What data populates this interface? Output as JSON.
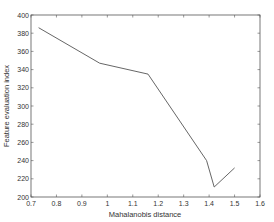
{
  "chart_data": {
    "type": "line",
    "title": "",
    "xlabel": "Mahalanobis distance",
    "ylabel": "Feature evaluation index",
    "xlim": [
      0.7,
      1.6
    ],
    "ylim": [
      200,
      400
    ],
    "xticks": [
      0.7,
      0.8,
      0.9,
      1,
      1.1,
      1.2,
      1.3,
      1.4,
      1.5,
      1.6
    ],
    "xtick_labels": [
      "0.7",
      "0.8",
      "0.9",
      "1",
      "1.1",
      "1.2",
      "1.3",
      "1.4",
      "1.5",
      "1.6"
    ],
    "yticks": [
      200,
      220,
      240,
      260,
      280,
      300,
      320,
      340,
      360,
      380,
      400
    ],
    "ytick_labels": [
      "200",
      "220",
      "240",
      "260",
      "280",
      "300",
      "320",
      "340",
      "360",
      "380",
      "400"
    ],
    "grid": false,
    "legend": null,
    "series": [
      {
        "name": "Feature evaluation index",
        "color": "#555555",
        "x": [
          0.73,
          0.97,
          1.16,
          1.39,
          1.42,
          1.5
        ],
        "y": [
          386,
          347,
          335,
          240,
          211,
          232
        ]
      }
    ]
  }
}
